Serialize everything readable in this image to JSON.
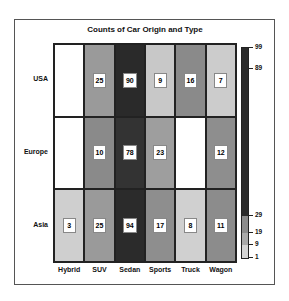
{
  "chart_data": {
    "type": "heatmap",
    "title": "Counts of Car Origin and Type",
    "xlabel": "",
    "ylabel": "",
    "x_categories": [
      "Hybrid",
      "SUV",
      "Sedan",
      "Sports",
      "Truck",
      "Wagon"
    ],
    "y_categories": [
      "USA",
      "Europe",
      "Asia"
    ],
    "values": [
      [
        null,
        25,
        90,
        9,
        16,
        7
      ],
      [
        null,
        10,
        78,
        23,
        null,
        12
      ],
      [
        3,
        25,
        94,
        17,
        8,
        11
      ]
    ],
    "cell_colors": [
      [
        "#ffffff",
        "#9a9a9a",
        "#2a2a2a",
        "#c8c8c8",
        "#8a8a8a",
        "#cccccc"
      ],
      [
        "#ffffff",
        "#8a8a8a",
        "#333333",
        "#9e9e9e",
        "#ffffff",
        "#8e8e8e"
      ],
      [
        "#cfcfcf",
        "#9a9a9a",
        "#2b2b2b",
        "#8e8e8e",
        "#d0d0d0",
        "#8c8c8c"
      ]
    ],
    "colorbar": {
      "ticks": [
        99,
        89,
        29,
        19,
        9,
        1
      ],
      "range": [
        1,
        99
      ],
      "segments": [
        {
          "from": 1,
          "to": 9,
          "color": "#d4d4d4"
        },
        {
          "from": 9,
          "to": 19,
          "color": "#aaaaaa"
        },
        {
          "from": 19,
          "to": 29,
          "color": "#8c8c8c"
        },
        {
          "from": 29,
          "to": 99,
          "color": "#2b2b2b"
        }
      ]
    },
    "legend_position": "right"
  }
}
